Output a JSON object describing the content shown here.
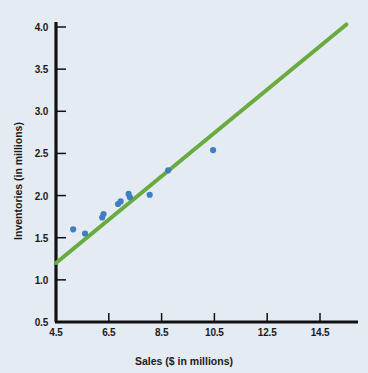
{
  "chart_data": {
    "type": "scatter",
    "title": "",
    "xlabel": "Sales ($ in millions)",
    "ylabel": "Inventories (in millions)",
    "xlim": [
      4.5,
      15.5
    ],
    "ylim": [
      0.5,
      4.0
    ],
    "xticks": [
      "4.5",
      "6.5",
      "8.5",
      "10.5",
      "12.5",
      "14.5"
    ],
    "xtick_values": [
      4.5,
      6.5,
      8.5,
      10.5,
      12.5,
      14.5
    ],
    "yticks": [
      "0.5",
      "1.0",
      "1.5",
      "2.0",
      "2.5",
      "3.0",
      "3.5",
      "4.0"
    ],
    "ytick_values": [
      0.5,
      1.0,
      1.5,
      2.0,
      2.5,
      3.0,
      3.5,
      4.0
    ],
    "grid": false,
    "legend": false,
    "series": [
      {
        "name": "Sales vs Inventories",
        "type": "scatter",
        "marker_color": "#3f7fc1",
        "marker_size": 5,
        "points": [
          {
            "x": 5.15,
            "y": 1.6
          },
          {
            "x": 5.6,
            "y": 1.55
          },
          {
            "x": 6.25,
            "y": 1.74
          },
          {
            "x": 6.3,
            "y": 1.78
          },
          {
            "x": 6.85,
            "y": 1.9
          },
          {
            "x": 6.95,
            "y": 1.93
          },
          {
            "x": 7.25,
            "y": 2.02
          },
          {
            "x": 7.3,
            "y": 1.98
          },
          {
            "x": 8.05,
            "y": 2.01
          },
          {
            "x": 8.75,
            "y": 2.3
          },
          {
            "x": 10.45,
            "y": 2.54
          }
        ]
      },
      {
        "name": "Regression line",
        "type": "line",
        "line_color": "#6aab3f",
        "line_width": 4,
        "x": [
          4.5,
          15.5
        ],
        "y": [
          1.2,
          4.03
        ]
      }
    ]
  },
  "axes": {
    "axis_color": "#111111",
    "background_color": "#e5ebf2"
  }
}
